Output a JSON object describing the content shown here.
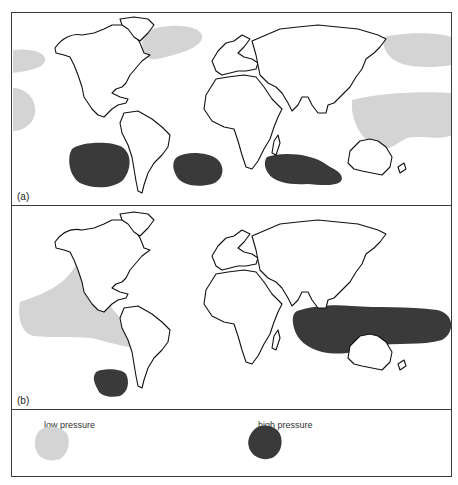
{
  "figure": {
    "panels": [
      {
        "id": "a",
        "label": "(a)",
        "regions": [
          {
            "type": "low",
            "location": "North Atlantic (south of Iceland)"
          },
          {
            "type": "low",
            "location": "North Pacific (east edge)"
          },
          {
            "type": "low",
            "location": "North Pacific (west edge)"
          },
          {
            "type": "low",
            "location": "Equatorial Pacific (west edge)"
          },
          {
            "type": "low",
            "location": "Western Pacific / Indonesia to Australia"
          },
          {
            "type": "high",
            "location": "Central Asia (Siberia/Mongolia)"
          },
          {
            "type": "high",
            "location": "South Pacific"
          },
          {
            "type": "high",
            "location": "South Atlantic"
          },
          {
            "type": "high",
            "location": "South Indian Ocean"
          }
        ]
      },
      {
        "id": "b",
        "label": "(b)",
        "regions": [
          {
            "type": "low",
            "location": "Eastern / Central Pacific"
          },
          {
            "type": "high",
            "location": "Central Asia"
          },
          {
            "type": "high",
            "location": "Indian Ocean to Western Pacific / Australia"
          },
          {
            "type": "high",
            "location": "South-east Pacific"
          }
        ]
      }
    ],
    "legend": {
      "low": {
        "label": "low pressure",
        "color": "#d4d4d4"
      },
      "high": {
        "label": "high pressure",
        "color": "#3a3a3a"
      }
    }
  }
}
